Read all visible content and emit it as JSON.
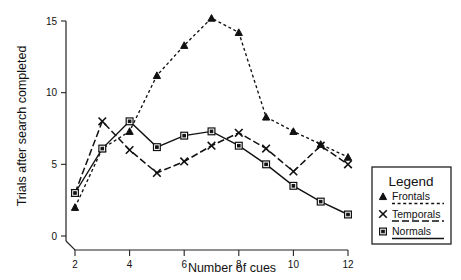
{
  "chart_data": {
    "type": "line",
    "title": "",
    "xlabel": "Number of cues",
    "ylabel": "Trials after search completed",
    "xlim": [
      2,
      12
    ],
    "ylim": [
      0,
      15
    ],
    "xticks": [
      2,
      4,
      6,
      8,
      10,
      12
    ],
    "yticks": [
      0,
      5,
      10,
      15
    ],
    "xtick_labels": [
      "2",
      "4",
      "6",
      "8",
      "10",
      "12"
    ],
    "ytick_labels": [
      "0",
      "5",
      "10",
      "15"
    ],
    "grid": false,
    "legend_position": "right-outside",
    "legend_title": "Legend",
    "x": [
      2,
      3,
      4,
      5,
      6,
      7,
      8,
      9,
      10,
      11,
      12
    ],
    "series": [
      {
        "name": "Frontals",
        "marker": "triangle",
        "linestyle": "dotted",
        "color": "#111111",
        "values": [
          2.0,
          6.1,
          7.3,
          11.2,
          13.3,
          15.2,
          14.2,
          8.3,
          7.3,
          6.4,
          5.5
        ]
      },
      {
        "name": "Temporals",
        "marker": "x",
        "linestyle": "dashdot",
        "color": "#111111",
        "values": [
          3.0,
          8.0,
          6.0,
          4.4,
          5.2,
          6.3,
          7.2,
          6.1,
          4.5,
          6.3,
          5.0
        ]
      },
      {
        "name": "Normals",
        "marker": "square",
        "linestyle": "solid",
        "color": "#111111",
        "values": [
          3.0,
          6.1,
          8.0,
          6.2,
          7.0,
          7.3,
          6.3,
          5.0,
          3.5,
          2.4,
          1.5
        ]
      }
    ]
  },
  "legend": {
    "title": "Legend",
    "entries": [
      {
        "label": "Frontals",
        "marker": "triangle",
        "linestyle": "dotted"
      },
      {
        "label": "Temporals",
        "marker": "x",
        "linestyle": "dashdot"
      },
      {
        "label": "Normals",
        "marker": "square",
        "linestyle": "solid"
      }
    ]
  },
  "axes": {
    "x_title": "Number of cues",
    "y_title": "Trials after search completed"
  }
}
